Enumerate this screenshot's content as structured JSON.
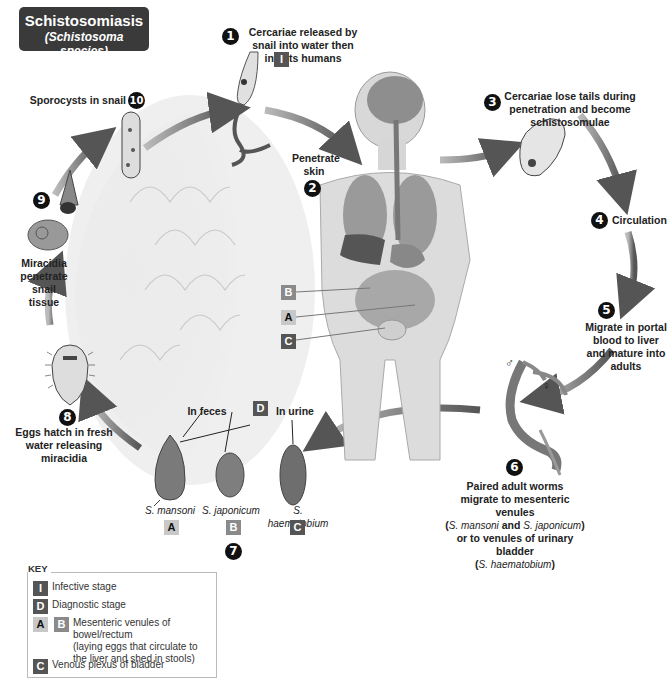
{
  "title": {
    "main": "Schistosomiasis",
    "subtitle": "(Schistosoma species)"
  },
  "steps": [
    {
      "number": "1",
      "label": "Cercariae released by snail into water then infects humans",
      "tag": "I"
    },
    {
      "number": "2",
      "label": "Penetrate skin"
    },
    {
      "number": "3",
      "label": "Cercariae lose tails during penetration and become schistosomulae"
    },
    {
      "number": "4",
      "label": "Circulation"
    },
    {
      "number": "5",
      "label": "Migrate in portal blood to liver and mature into adults"
    },
    {
      "number": "6",
      "label_line1": "Paired adult worms",
      "label_line2": "migrate to mesenteric venules",
      "label_species1": "S. mansoni",
      "label_and": "and",
      "label_species2": "S. japonicum",
      "label_line4": "or to venules of urinary bladder",
      "label_species3": "S. haematobium"
    },
    {
      "number": "7",
      "label": ""
    },
    {
      "number": "8",
      "label": "Eggs hatch in fresh water releasing miracidia"
    },
    {
      "number": "9",
      "label": "Miracidia penetrate snail tissue"
    },
    {
      "number": "10",
      "label": "Sporocysts in snail"
    }
  ],
  "worm_sex": {
    "male": "♂",
    "female": "♀"
  },
  "eggs": {
    "diagnostic_tag": "D",
    "in_feces": "In feces",
    "in_urine": "In urine",
    "items": [
      {
        "species": "S. mansoni",
        "tag": "A"
      },
      {
        "species": "S. japonicum",
        "tag": "B"
      },
      {
        "species": "S. haematobium",
        "tag": "C"
      }
    ]
  },
  "body_tags": [
    "B",
    "A",
    "C"
  ],
  "key": {
    "title": "KEY",
    "rows": [
      {
        "tags": [
          "I"
        ],
        "text": "Infective stage"
      },
      {
        "tags": [
          "D"
        ],
        "text": "Diagnostic stage"
      },
      {
        "tags": [
          "A",
          "B"
        ],
        "text_line1": "Mesenteric venules of bowel/rectum",
        "text_line2": "(laying eggs that circulate to",
        "text_line3": "the liver and shed in stools)"
      },
      {
        "tags": [
          "C"
        ],
        "text": "Venous plexus of bladder"
      }
    ]
  },
  "colors": {
    "title_bg": "#3a3a3a",
    "tag_dark": "#555555",
    "tag_mid": "#8a8a8a",
    "tag_light": "#c8c8c8",
    "arrow": "#777777"
  }
}
